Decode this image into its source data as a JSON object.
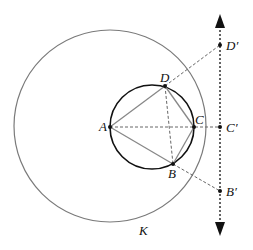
{
  "diagram": {
    "circle_K": {
      "label": "K",
      "cx": 110,
      "cy": 126,
      "r": 96,
      "color": "#777777"
    },
    "small_circle": {
      "cx": 152,
      "cy": 127,
      "r": 42,
      "color": "#111111"
    },
    "line": {
      "x": 220,
      "y1": 14,
      "y2": 236,
      "style": "dashed",
      "arrows": "both"
    },
    "points": [
      {
        "id": "A",
        "label": "A",
        "x": 110,
        "y": 127
      },
      {
        "id": "B",
        "label": "B",
        "x": 173,
        "y": 164
      },
      {
        "id": "C",
        "label": "C",
        "x": 194,
        "y": 127
      },
      {
        "id": "D",
        "label": "D",
        "x": 165,
        "y": 86
      },
      {
        "id": "Bp",
        "label": "B′",
        "x": 220,
        "y": 191
      },
      {
        "id": "Cp",
        "label": "C′",
        "x": 220,
        "y": 127
      },
      {
        "id": "Dp",
        "label": "D′",
        "x": 220,
        "y": 45
      }
    ],
    "labels": {
      "A": "A",
      "B": "B",
      "C": "C",
      "D": "D",
      "Bp": "B′",
      "Cp": "C′",
      "Dp": "D′",
      "K": "K"
    }
  }
}
